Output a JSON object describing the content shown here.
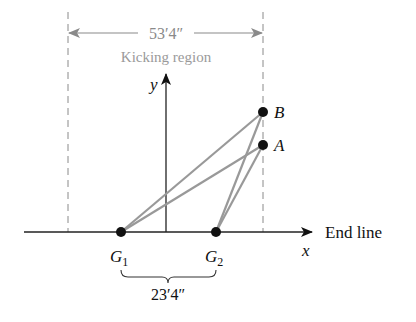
{
  "dimension_top": {
    "label": "53′4″",
    "caption": "Kicking region"
  },
  "dimension_bottom": {
    "label": "23′4″"
  },
  "axes": {
    "x_label": "x",
    "y_label": "y",
    "end_line_label": "End line"
  },
  "points": {
    "A": {
      "label": "A"
    },
    "B": {
      "label": "B"
    },
    "G1": {
      "label": "G",
      "sub": "1"
    },
    "G2": {
      "label": "G",
      "sub": "2"
    }
  },
  "colors": {
    "ink": "#111111",
    "gray": "#8a8a8a",
    "line_gray": "#999999"
  }
}
